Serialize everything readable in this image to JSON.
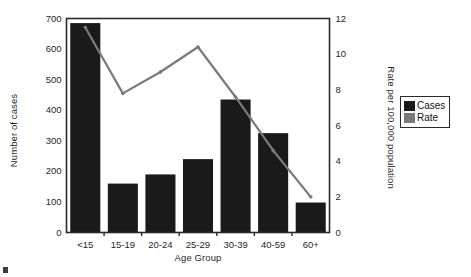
{
  "chart_data": {
    "type": "bar",
    "title": "",
    "xlabel": "Age Group",
    "ylabel": "Number of cases",
    "ylabel_right": "Rate per 100,000 population",
    "categories": [
      "<15",
      "15-19",
      "20-24",
      "25-29",
      "30-39",
      "40-59",
      "60+"
    ],
    "ylim": [
      0,
      700
    ],
    "ylim_right": [
      0,
      12
    ],
    "yticks": [
      0,
      100,
      200,
      300,
      400,
      500,
      600,
      700
    ],
    "yticks_right": [
      0,
      2,
      4,
      6,
      8,
      10,
      12
    ],
    "grid": false,
    "legend_position": "right-outside",
    "series": [
      {
        "name": "Cases",
        "kind": "bar",
        "axis": "left",
        "color": "#1a1a1a",
        "values": [
          685,
          160,
          190,
          240,
          435,
          325,
          98
        ]
      },
      {
        "name": "Rate",
        "kind": "line",
        "axis": "right",
        "color": "#7a7a7a",
        "values": [
          11.5,
          7.8,
          9.0,
          10.4,
          7.6,
          4.6,
          2.0
        ]
      }
    ]
  },
  "legend": {
    "items": [
      {
        "label": "Cases",
        "color": "#1a1a1a"
      },
      {
        "label": "Rate",
        "color": "#7a7a7a"
      }
    ]
  },
  "colors": {
    "bar": "#1a1a1a",
    "line": "#7a7a7a",
    "frame": "#2b2b2b",
    "text": "#1f1f1f",
    "background": "#ffffff"
  }
}
